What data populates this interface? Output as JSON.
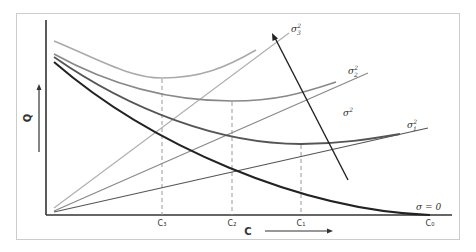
{
  "diagram": {
    "axes": {
      "y_label": "Q",
      "x_label": "C",
      "x_ticks": [
        "C₃",
        "C₂",
        "C₁",
        "C₀"
      ]
    },
    "curve_labels": {
      "sigma3": "σ",
      "sigma3_sub": "3",
      "sigma2": "σ",
      "sigma2_sub": "2",
      "sigma1": "σ",
      "sigma1_sub": "1",
      "sigma_sq": "σ",
      "sup": "2",
      "sigma_zero": "σ = 0"
    },
    "colors": {
      "frame": "#cccccc",
      "axis": "#333333",
      "sigma3": "#aaaaaa",
      "sigma2": "#888888",
      "sigma1": "#555555",
      "sigma0": "#222222",
      "dashed": "#999999"
    }
  }
}
